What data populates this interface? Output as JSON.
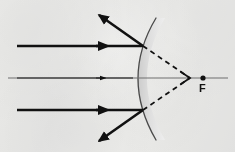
{
  "diagram": {
    "type": "optics-ray-diagram",
    "canvas": {
      "width": 235,
      "height": 152
    },
    "background_color": "#f2f2f1",
    "labels": {
      "focal_point": "F"
    },
    "colors": {
      "ray_stroke": "#111111",
      "axis_stroke": "#6e6e6e",
      "mirror_arc_stroke": "#4a4a4a",
      "mirror_band_fill": "#d9d9d9",
      "dashed_stroke": "#111111",
      "focal_dot_fill": "#111111"
    },
    "optical_axis": {
      "name": "principal-axis",
      "y": 78,
      "x_start": 8,
      "x_end": 228,
      "stroke_width": 1.1
    },
    "mirror": {
      "name": "convex-mirror",
      "shape": "convex-arc-facing-left",
      "vertex": {
        "x": 133,
        "y": 78
      },
      "top_end": {
        "x": 156,
        "y": 18
      },
      "bottom_end": {
        "x": 156,
        "y": 140
      },
      "band_thickness": 9,
      "arc_stroke_width": 1.3
    },
    "focal_point": {
      "name": "focal-point-F",
      "x": 203,
      "y": 78,
      "dot_radius": 2.6,
      "label_x": 203,
      "label_y": 84
    },
    "convergence_marker": {
      "name": "virtual-focus-arrowhead",
      "x": 188,
      "y": 78
    },
    "incident_rays": [
      {
        "name": "incident-ray-upper",
        "x_start": 17,
        "y": 46,
        "x_end": 143,
        "arrow_at_x": 100,
        "stroke_width": 2.6
      },
      {
        "name": "incident-ray-axial",
        "x_start": 17,
        "y": 78,
        "x_end": 133,
        "arrow_at_x": 100,
        "stroke_width": 1.6
      },
      {
        "name": "incident-ray-lower",
        "x_start": 17,
        "y": 110,
        "x_end": 143,
        "arrow_at_x": 100,
        "stroke_width": 2.6
      }
    ],
    "reflected_rays": [
      {
        "name": "reflected-ray-upper",
        "x_start": 143,
        "y_start": 46,
        "x_end": 99,
        "y_end": 15,
        "stroke_width": 2.6
      },
      {
        "name": "reflected-ray-lower",
        "x_start": 143,
        "y_start": 110,
        "x_end": 99,
        "y_end": 141,
        "stroke_width": 2.6
      }
    ],
    "virtual_extensions": [
      {
        "name": "dashed-extension-upper",
        "x_start": 143,
        "y_start": 46,
        "x_end": 190,
        "y_end": 78,
        "dash_pattern": "5,4",
        "stroke_width": 1.8
      },
      {
        "name": "dashed-extension-lower",
        "x_start": 143,
        "y_start": 110,
        "x_end": 190,
        "y_end": 78,
        "dash_pattern": "5,4",
        "stroke_width": 1.8
      }
    ]
  }
}
